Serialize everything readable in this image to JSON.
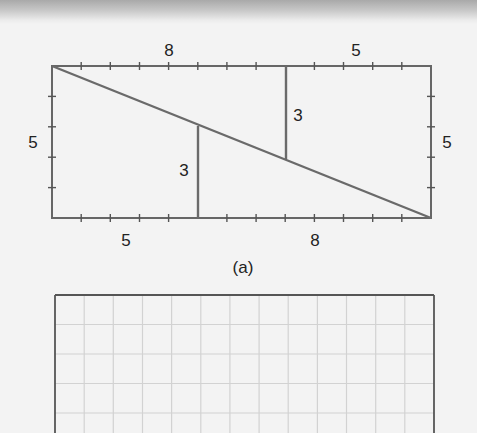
{
  "figure": {
    "caption": "(a)",
    "rectangle": {
      "width_units": 13,
      "height_units": 5,
      "top_labels": [
        "8",
        "5"
      ],
      "bottom_labels": [
        "5",
        "8"
      ],
      "left_label": "5",
      "right_label": "5",
      "left_inner_segment_label": "3",
      "right_inner_segment_label": "3",
      "line_color": "#6a6a6a"
    },
    "grid": {
      "columns": 13,
      "visible_rows": 4,
      "border_color": "#555555",
      "grid_color": "#cfcfcf"
    }
  }
}
